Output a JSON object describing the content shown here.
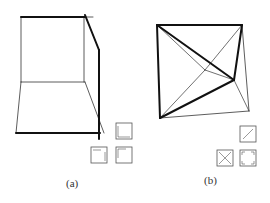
{
  "figure": {
    "panels": [
      {
        "id": "a",
        "label": "(a)",
        "description": "Room-like box with thick edge path along top, right diagonal and right vertical",
        "icons": [
          "corner-bottom-right",
          "corner-top-left-bottom-right",
          "corner-top-left"
        ]
      },
      {
        "id": "b",
        "label": "(b)",
        "description": "Quadrilateral subdivided by diagonals meeting at interior points, thick edges forming a path",
        "icons": [
          "diagonal-slash",
          "cross-x",
          "four-corners"
        ]
      }
    ],
    "caption": ""
  },
  "colors": {
    "stroke": "#111111",
    "thin": "#333333",
    "icon": "#555555"
  }
}
